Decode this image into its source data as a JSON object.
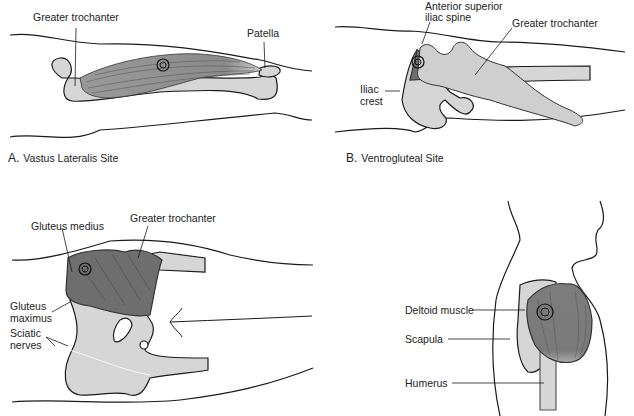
{
  "panels": {
    "a": {
      "caption_letter": "A.",
      "caption_text": "Vastus Lateralis Site",
      "labels": {
        "greater_trochanter": "Greater trochanter",
        "patella": "Patella"
      }
    },
    "b": {
      "caption_letter": "B.",
      "caption_text": "Ventrogluteal Site",
      "labels": {
        "asis_line1": "Anterior superior",
        "asis_line2": "iliac spine",
        "greater_trochanter": "Greater trochanter",
        "iliac_line1": "Iliac",
        "iliac_line2": "crest"
      }
    },
    "c": {
      "labels": {
        "gluteus_medius": "Gluteus medius",
        "greater_trochanter": "Greater trochanter",
        "gmax_line1": "Gluteus",
        "gmax_line2": "maximus",
        "sciatic_line1": "Sciatic",
        "sciatic_line2": "nerves"
      }
    },
    "d": {
      "labels": {
        "deltoid": "Deltoid muscle",
        "scapula": "Scapula",
        "humerus": "Humerus"
      }
    }
  },
  "colors": {
    "bone": "#d6d6d6",
    "muscle": "#8a8a8a",
    "muscle_dark": "#6e6e6e",
    "outline": "#1a1a1a"
  }
}
